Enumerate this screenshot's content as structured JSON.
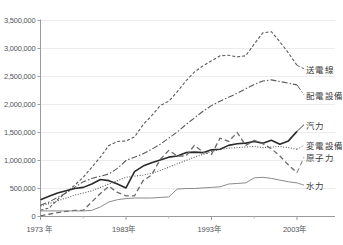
{
  "chart_data": {
    "type": "line",
    "title": "",
    "subtitle": "",
    "xlabel": "",
    "ylabel": "",
    "grid": true,
    "legend_position": "right-inline-labels",
    "xlim": [
      1973,
      2003
    ],
    "ylim": [
      0,
      3500000
    ],
    "x": [
      1973,
      1974,
      1975,
      1976,
      1977,
      1978,
      1979,
      1980,
      1981,
      1982,
      1983,
      1984,
      1985,
      1986,
      1987,
      1988,
      1989,
      1990,
      1991,
      1992,
      1993,
      1994,
      1995,
      1996,
      1997,
      1998,
      1999,
      2000,
      2001,
      2002,
      2003
    ],
    "y_ticks": [
      0,
      500000,
      1000000,
      1500000,
      2000000,
      2500000,
      3000000,
      3500000
    ],
    "y_tick_labels": [
      "0",
      "500,000",
      "1,000,000",
      "1,500,000",
      "2,000,000",
      "2,500,000",
      "3,000,000",
      "3,500,000"
    ],
    "x_ticks": [
      1973,
      1983,
      1993,
      2003
    ],
    "x_tick_labels": [
      "1973 年",
      "1983年",
      "1993年",
      "2003年"
    ],
    "x_minor_ticks": [
      1978,
      1988,
      1998
    ],
    "series": [
      {
        "name": "送電線",
        "label": "送電線",
        "style": "dashed",
        "color": "#5a5a5a",
        "width": 1.1,
        "dash": "3,2",
        "label_x": 2003,
        "label_y": 2640000,
        "values": [
          110000,
          150000,
          300000,
          430000,
          560000,
          700000,
          880000,
          1060000,
          1270000,
          1340000,
          1350000,
          1420000,
          1640000,
          1800000,
          1980000,
          2060000,
          2230000,
          2420000,
          2580000,
          2690000,
          2780000,
          2870000,
          2880000,
          2850000,
          2870000,
          3080000,
          3280000,
          3300000,
          3120000,
          2920000,
          2700000
        ]
      },
      {
        "name": "配電設備",
        "label": "配電設備",
        "style": "dash-dot",
        "color": "#5a5a5a",
        "width": 1.1,
        "dash": "6,2,1.5,2",
        "label_x": 2003,
        "label_y": 2170000,
        "values": [
          200000,
          260000,
          340000,
          420000,
          520000,
          620000,
          680000,
          720000,
          760000,
          860000,
          1000000,
          1060000,
          1120000,
          1200000,
          1290000,
          1400000,
          1510000,
          1640000,
          1760000,
          1880000,
          1980000,
          2060000,
          2130000,
          2200000,
          2280000,
          2360000,
          2420000,
          2440000,
          2410000,
          2380000,
          2350000
        ]
      },
      {
        "name": "汽力",
        "label": "汽力",
        "style": "solid",
        "color": "#2a2a2a",
        "width": 1.6,
        "dash": "none",
        "label_x": 2003,
        "label_y": 1640000,
        "values": [
          300000,
          360000,
          420000,
          460000,
          500000,
          520000,
          580000,
          660000,
          640000,
          580000,
          510000,
          800000,
          900000,
          960000,
          1010000,
          1060000,
          1080000,
          1140000,
          1150000,
          1140000,
          1190000,
          1200000,
          1270000,
          1300000,
          1310000,
          1340000,
          1310000,
          1360000,
          1290000,
          1350000,
          1520000
        ]
      },
      {
        "name": "変電設備",
        "label": "変電設備",
        "style": "dotted",
        "color": "#5a5a5a",
        "width": 1.1,
        "dash": "1,1.6",
        "label_x": 2003,
        "label_y": 1270000,
        "values": [
          190000,
          230000,
          280000,
          330000,
          380000,
          420000,
          460000,
          520000,
          580000,
          640000,
          700000,
          720000,
          740000,
          770000,
          820000,
          880000,
          940000,
          1000000,
          1060000,
          1110000,
          1160000,
          1200000,
          1220000,
          1230000,
          1240000,
          1250000,
          1230000,
          1240000,
          1250000,
          1230000,
          1200000
        ]
      },
      {
        "name": "原子力",
        "label": "原子力",
        "style": "dashed-long",
        "color": "#6a6a6a",
        "width": 1.3,
        "dash": "5,3",
        "label_x": 2003,
        "label_y": 1060000,
        "values": [
          10000,
          40000,
          70000,
          90000,
          110000,
          110000,
          260000,
          410000,
          540000,
          430000,
          370000,
          370000,
          640000,
          740000,
          1020000,
          1180000,
          1080000,
          1080000,
          1270000,
          1150000,
          1110000,
          1400000,
          1340000,
          1500000,
          1270000,
          1360000,
          1300000,
          1210000,
          1080000,
          920000,
          780000
        ]
      },
      {
        "name": "水力",
        "label": "水力",
        "style": "solid-thin",
        "color": "#8a8a8a",
        "width": 1.0,
        "dash": "none",
        "label_x": 2003,
        "label_y": 560000,
        "values": [
          100000,
          100000,
          100000,
          100000,
          100000,
          100000,
          110000,
          170000,
          260000,
          300000,
          320000,
          330000,
          330000,
          330000,
          340000,
          350000,
          490000,
          500000,
          500000,
          510000,
          520000,
          530000,
          580000,
          590000,
          600000,
          690000,
          700000,
          680000,
          650000,
          620000,
          600000
        ]
      }
    ]
  },
  "axis": {
    "y_tick_labels": [
      "3,500,000",
      "3,000,000",
      "2,500,000",
      "2,000,000",
      "1,500,000",
      "1,000,000",
      "500,000",
      "0"
    ],
    "x_tick_labels": [
      "1973 年",
      "1983年",
      "1993年",
      "2003年"
    ]
  },
  "corner_note": {
    "text": ""
  }
}
